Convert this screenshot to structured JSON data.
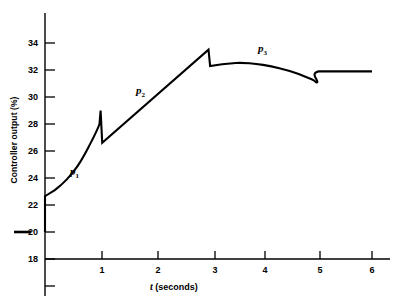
{
  "chart_data": {
    "type": "line",
    "title": "",
    "xlabel": "t (seconds)",
    "xlabel_symbol": "t",
    "xlabel_unit": "(seconds)",
    "ylabel": "Controller output (%)",
    "xlim": [
      0,
      6.3
    ],
    "ylim": [
      18,
      35
    ],
    "grid": false,
    "legend": "none",
    "axis_break_marker": true,
    "axis_break_at": 20,
    "xticks": [
      1,
      2,
      3,
      4,
      5,
      6
    ],
    "xtick_labels": [
      "1",
      "2",
      "3",
      "4",
      "5",
      "6"
    ],
    "yticks": [
      18,
      20,
      22,
      24,
      26,
      28,
      30,
      32,
      34
    ],
    "ytick_labels": [
      "18",
      "20",
      "22",
      "24",
      "26",
      "28",
      "30",
      "32",
      "34"
    ],
    "series": [
      {
        "name": "controller output",
        "points": [
          [
            0.0,
            20.0
          ],
          [
            0.0,
            22.65
          ],
          [
            0.18,
            23.1
          ],
          [
            0.4,
            23.9
          ],
          [
            0.6,
            24.9
          ],
          [
            0.8,
            26.3
          ],
          [
            1.0,
            28.0
          ],
          [
            1.02,
            29.0
          ],
          [
            1.05,
            26.6
          ],
          [
            3.0,
            33.5
          ],
          [
            3.03,
            32.3
          ],
          [
            3.25,
            32.42
          ],
          [
            3.5,
            32.52
          ],
          [
            3.75,
            32.5
          ],
          [
            4.0,
            32.38
          ],
          [
            4.3,
            32.13
          ],
          [
            4.6,
            31.78
          ],
          [
            4.9,
            31.3
          ],
          [
            5.0,
            31.1
          ],
          [
            5.02,
            31.9
          ],
          [
            6.0,
            31.9
          ]
        ]
      }
    ],
    "annotations": [
      {
        "id": "p1",
        "text": "p",
        "sub": "1",
        "x": 0.72,
        "y": 24.9
      },
      {
        "id": "p2",
        "text": "p",
        "sub": "2",
        "x": 1.95,
        "y": 30.9
      },
      {
        "id": "p3",
        "text": "p",
        "sub": "3",
        "x": 4.08,
        "y": 34.0
      }
    ],
    "colors": {
      "line": "#000000",
      "axis": "#000000",
      "background": "#ffffff"
    }
  }
}
